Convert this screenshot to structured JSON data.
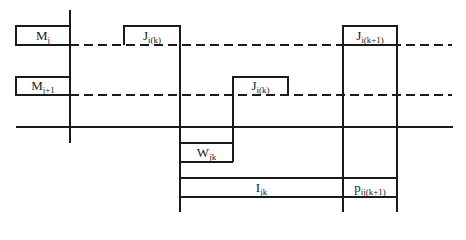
{
  "diagram": {
    "type": "gantt-schedule",
    "machines": [
      {
        "id": "Mj",
        "base": "M",
        "sub": "j"
      },
      {
        "id": "Mj+1",
        "base": "M",
        "sub": "j+1"
      }
    ],
    "operations": [
      {
        "id": "J_i(k)_on_Mj",
        "base": "J",
        "sub": "i(k)",
        "row": "Mj"
      },
      {
        "id": "J_i(k+1)_on_Mj",
        "base": "J",
        "sub": "i(k+1)",
        "row": "Mj"
      },
      {
        "id": "J_i(k)_on_Mj+1",
        "base": "J",
        "sub": "i(k)",
        "row": "Mj+1"
      }
    ],
    "intervals": [
      {
        "id": "W",
        "base": "W",
        "sub": "jk"
      },
      {
        "id": "I",
        "base": "I",
        "sub": "jk"
      },
      {
        "id": "p",
        "base": "p",
        "sub": "ij(k+1)"
      }
    ],
    "stroke_color": "#1a1a1a"
  }
}
